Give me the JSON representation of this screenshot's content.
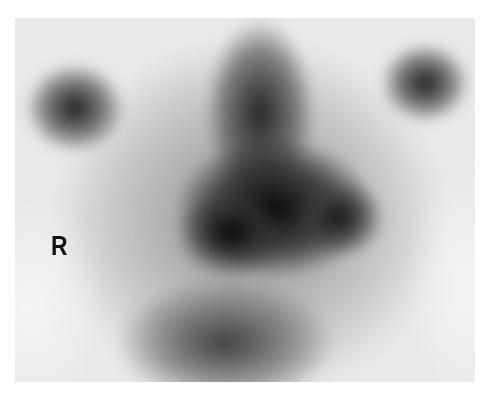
{
  "image": {
    "type": "grayscale nuclear medicine scan",
    "orientation_label": "R"
  }
}
